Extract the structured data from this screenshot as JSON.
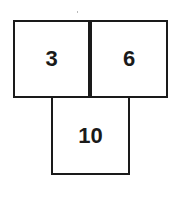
{
  "diagram": {
    "boxes": [
      {
        "label": "3",
        "position": "top-left"
      },
      {
        "label": "6",
        "position": "top-right"
      },
      {
        "label": "10",
        "position": "bottom-center"
      }
    ]
  }
}
